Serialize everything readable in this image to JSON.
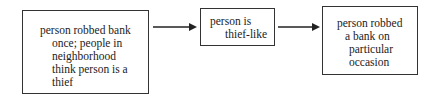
{
  "diagram": {
    "nodes": [
      {
        "id": "n1",
        "lines": [
          "person robbed bank",
          "once; people in",
          "neighborhood",
          "think person is a",
          "thief"
        ]
      },
      {
        "id": "n2",
        "lines": [
          "person is",
          "thief-like"
        ]
      },
      {
        "id": "n3",
        "lines": [
          "person robbed",
          "a bank on",
          "particular",
          "occasion"
        ]
      }
    ],
    "edges": [
      {
        "from": "n1",
        "to": "n2"
      },
      {
        "from": "n2",
        "to": "n3"
      }
    ]
  }
}
